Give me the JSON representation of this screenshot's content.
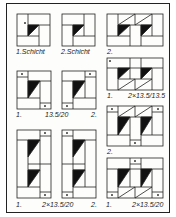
{
  "labels": {
    "p1": "1.Schicht",
    "p2": "2.Schicht",
    "p3": "2.",
    "p4a": "1.",
    "p4b": "2×13.5/13.5",
    "p5a": "1.",
    "p5b": "13.5/20",
    "p5c": "2.",
    "p6": "2.",
    "p7a": "1.",
    "p7b": "2×13.5/20",
    "p7c": "2.",
    "p8a": "1.",
    "p8b": "2×13.5/20"
  },
  "colors": {
    "line": "#222222",
    "fill": "#111111",
    "bg": "#fdfdfb"
  }
}
